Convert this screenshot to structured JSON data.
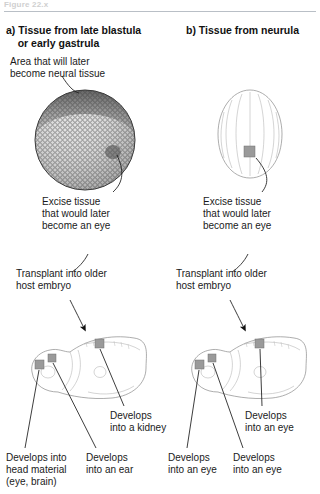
{
  "figure": {
    "caption_stub": "Figure 22.x",
    "divider": true
  },
  "panels": [
    {
      "id": "a",
      "title": "a) Tissue from late blastula\n    or early gastrula",
      "stage_label": "late blastula / early gastrula",
      "specimen": "blastula-sphere",
      "annotations": {
        "area_note": "Area that will later\nbecome neural tissue",
        "excise": "Excise tissue\nthat would later\nbecome an eye",
        "transplant": "Transplant into older\nhost embryo"
      },
      "outcomes": [
        {
          "site": "anterior-head",
          "text": "Develops into\nhead material\n(eye, brain)"
        },
        {
          "site": "otic-ear",
          "text": "Develops\ninto an ear"
        },
        {
          "site": "dorsal-trunk",
          "text": "Develops\ninto a kidney"
        }
      ]
    },
    {
      "id": "b",
      "title": "b) Tissue from neurula",
      "stage_label": "neurula",
      "specimen": "neurula-oval",
      "annotations": {
        "area_note": "",
        "excise": "Excise tissue\nthat would later\nbecome an eye",
        "transplant": "Transplant into older\nhost embryo"
      },
      "outcomes": [
        {
          "site": "anterior-head",
          "text": "Develops\ninto an eye"
        },
        {
          "site": "otic-ear",
          "text": "Develops\ninto an eye"
        },
        {
          "site": "dorsal-trunk",
          "text": "Develops\ninto an eye"
        }
      ]
    }
  ],
  "colors": {
    "ink": "#1a1a1a",
    "outline": "#8a8a8a",
    "patch": "#9a9a9a",
    "rule": "#b9bfc6",
    "caption_stub": "#cfcfcf"
  }
}
